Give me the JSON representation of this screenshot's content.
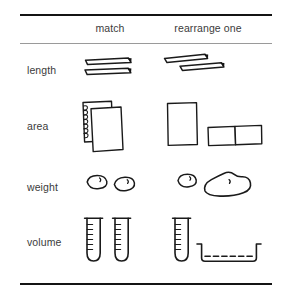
{
  "figure": {
    "background_color": "#ffffff",
    "ink_color": "#1a1a1a",
    "text_color": "#3b3b3b",
    "rule_color_strong": "#141414",
    "rule_color_light": "#9a9a9a"
  },
  "columns": {
    "label_col": "",
    "match": "match",
    "rearrange": "rearrange one"
  },
  "rows": [
    {
      "label": "length",
      "match": {
        "icon": "two-parallel-sticks",
        "description": "two equal horizontal sticks aligned one above the other",
        "count": 2
      },
      "rearrange": {
        "icon": "two-staggered-sticks",
        "description": "two equal sticks, the lower one shifted right and slightly tilted",
        "count": 2
      }
    },
    {
      "label": "area",
      "match": {
        "icon": "two-overlapping-sheets",
        "description": "two equal rectangular sheets overlapping, back sheet with spiral binding edge",
        "count": 2
      },
      "rearrange": {
        "icon": "upright-sheet-and-two-split-sheets",
        "description": "one upright rectangle beside two horizontal rectangles placed side by side",
        "count": 3
      }
    },
    {
      "label": "weight",
      "match": {
        "icon": "two-small-clay-blobs",
        "description": "two equal small oval clay balls",
        "count": 2
      },
      "rearrange": {
        "icon": "small-blob-and-large-blob",
        "description": "one small oval clay ball beside one large flattened irregular clay mass",
        "count": 2
      }
    },
    {
      "label": "volume",
      "match": {
        "icon": "two-test-tubes",
        "description": "two identical graduated test tubes",
        "count": 2
      },
      "rearrange": {
        "icon": "test-tube-and-shallow-dish",
        "description": "one graduated test tube beside a wide shallow dish holding liquid",
        "count": 2
      }
    }
  ]
}
